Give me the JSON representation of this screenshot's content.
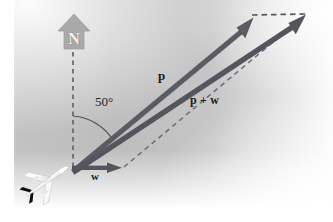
{
  "figure": {
    "background": {
      "panel_fill_dark": "#b9b9b9",
      "panel_fill_light": "#f4f4f4",
      "page_fill": "#ffffff"
    },
    "colors": {
      "vector": "#5f5f66",
      "vector_dark": "#4a4a52",
      "dashed": "#63636a",
      "compass_fill": "#a8a8a8",
      "compass_letter": "#f2f2f2",
      "plane_body": "#fdfdfd",
      "plane_accent": "#0e0e0e",
      "text": "#1c1c1c"
    },
    "compass": {
      "name": "north-indicator",
      "letter": "N"
    },
    "angle": {
      "name": "heading-angle",
      "label": "50°",
      "value_degrees": 50,
      "from": "north",
      "to": "p"
    },
    "vectors": [
      {
        "name": "p",
        "label": "p",
        "style": "solid-arrow",
        "from": [
          72,
          168
        ],
        "to": [
          253,
          17
        ]
      },
      {
        "name": "w",
        "label": "w",
        "style": "solid-arrow",
        "from": [
          72,
          168
        ],
        "to": [
          121,
          168
        ]
      },
      {
        "name": "p+w",
        "label": "p + w",
        "style": "solid-arrow",
        "from": [
          72,
          168
        ],
        "to": [
          305,
          14
        ]
      }
    ],
    "dashed_lines": [
      {
        "name": "north-reference-line",
        "from": [
          72,
          52
        ],
        "to": [
          72,
          168
        ]
      },
      {
        "name": "translated-w-top",
        "from": [
          253,
          17
        ],
        "to": [
          305,
          15
        ]
      },
      {
        "name": "translated-p-diagonal",
        "from": [
          124,
          168
        ],
        "to": [
          305,
          16
        ]
      }
    ],
    "plane": {
      "name": "airplane-icon",
      "position": [
        48,
        180
      ],
      "heading": "up-right"
    }
  }
}
